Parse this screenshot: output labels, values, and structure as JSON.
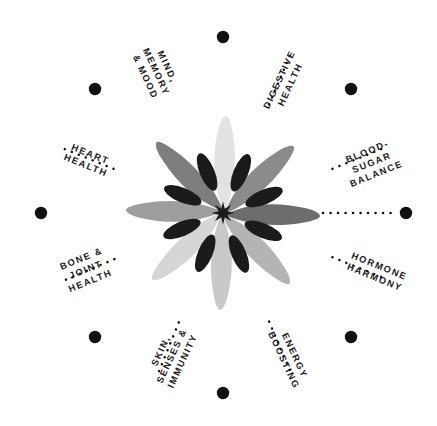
{
  "diagram": {
    "center": {
      "x": 223,
      "y": 213
    },
    "ring_radius": 181,
    "background_color": "#ffffff",
    "text_color": "#1c1c1c",
    "dot_color": "#111111",
    "dot_radius": 6.2,
    "connector_style": "dotted"
  },
  "spokes": [
    {
      "id": "mind-memory-mood",
      "label_lines": [
        "MIND,",
        "MEMORY",
        "& MOOD"
      ],
      "line1": "MIND,",
      "line2": "MEMORY",
      "line3": "& MOOD",
      "angle_deg": -67,
      "rotation_deg": 65,
      "label_x": 156,
      "label_y": 72,
      "dot_x": 223,
      "dot_y": 37
    },
    {
      "id": "digestive-health",
      "label_lines": [
        "DIGESTIVE",
        "HEALTH"
      ],
      "line1": "DIGESTIVE",
      "line2": "HEALTH",
      "line3": "",
      "angle_deg": -22,
      "rotation_deg": -65,
      "label_x": 285,
      "label_y": 82,
      "dot_x": 351,
      "dot_y": 89
    },
    {
      "id": "blood-sugar-balance",
      "label_lines": [
        "BLOOD-",
        "SUGAR",
        "BALANCE"
      ],
      "line1": "BLOOD-",
      "line2": "SUGAR",
      "line3": "BALANCE",
      "angle_deg": 0,
      "rotation_deg": -22,
      "label_x": 372,
      "label_y": 163,
      "dot_x": 406,
      "dot_y": 213
    },
    {
      "id": "hormone-harmony",
      "label_lines": [
        "HORMONE",
        "HARMONY"
      ],
      "line1": "HORMONE",
      "line2": "HARMONY",
      "line3": "",
      "angle_deg": 22,
      "rotation_deg": 22,
      "label_x": 377,
      "label_y": 272,
      "dot_x": 351,
      "dot_y": 337
    },
    {
      "id": "energy-boosting",
      "label_lines": [
        "ENERGY",
        "BOOSTING"
      ],
      "line1": "ENERGY",
      "line2": "BOOSTING",
      "line3": "",
      "angle_deg": 67,
      "rotation_deg": 65,
      "label_x": 289,
      "label_y": 358,
      "dot_x": 223,
      "dot_y": 393
    },
    {
      "id": "skin-senses-immunity",
      "label_lines": [
        "SKIN,",
        "SENSES &",
        "IMMUNITY"
      ],
      "line1": "SKIN,",
      "line2": "SENSES &",
      "line3": "IMMUNITY",
      "angle_deg": 112,
      "rotation_deg": -65,
      "label_x": 172,
      "label_y": 356,
      "dot_x": 95,
      "dot_y": 337
    },
    {
      "id": "bone-joint-health",
      "label_lines": [
        "BONE &",
        "JOINT",
        "HEALTH"
      ],
      "line1": "BONE &",
      "line2": "JOINT",
      "line3": "HEALTH",
      "angle_deg": 157,
      "rotation_deg": -22,
      "label_x": 86,
      "label_y": 270,
      "dot_x": 41,
      "dot_y": 213
    },
    {
      "id": "heart-health",
      "label_lines": [
        "HEART",
        "HEALTH"
      ],
      "line1": "HEART",
      "line2": "HEALTH",
      "line3": "",
      "angle_deg": 202,
      "rotation_deg": 22,
      "label_x": 88,
      "label_y": 160,
      "dot_x": 95,
      "dot_y": 89
    }
  ],
  "flower": {
    "name": "eight-petal-flower-illustration",
    "petal_count": 8,
    "center_star_color": "#1b1b1b",
    "petal_colors": [
      "#e2e2e2",
      "#8b8b8b",
      "#6d6d6d",
      "#b4b4b4",
      "#c9c9c9",
      "#d6d6d6",
      "#9e9e9e",
      "#7e7e7e"
    ],
    "seed_color": "#1b1b1b"
  }
}
